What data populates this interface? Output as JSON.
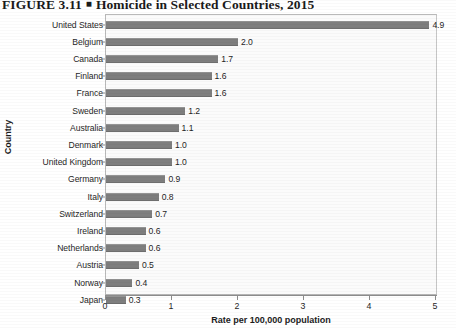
{
  "figure": {
    "number": "FIGURE 3.11",
    "separator": "■",
    "title": "Homicide in Selected Countries, 2015"
  },
  "chart_data": {
    "type": "bar",
    "orientation": "horizontal",
    "title": "Homicide in Selected Countries, 2015",
    "xlabel": "Rate per 100,000 population",
    "ylabel": "Country",
    "xlim": [
      0,
      5
    ],
    "xticks": [
      "0",
      "1",
      "2",
      "3",
      "4",
      "5"
    ],
    "grid": false,
    "legend": null,
    "categories": [
      "United States",
      "Belgium",
      "Canada",
      "Finland",
      "France",
      "Sweden",
      "Australia",
      "Denmark",
      "United Kingdom",
      "Germany",
      "Italy",
      "Switzerland",
      "Ireland",
      "Netherlands",
      "Austria",
      "Norway",
      "Japan"
    ],
    "values": [
      4.9,
      2.0,
      1.7,
      1.6,
      1.6,
      1.2,
      1.1,
      1.0,
      1.0,
      0.9,
      0.8,
      0.7,
      0.6,
      0.6,
      0.5,
      0.4,
      0.3
    ],
    "value_labels": [
      "4.9",
      "2.0",
      "1.7",
      "1.6",
      "1.6",
      "1.2",
      "1.1",
      "1.0",
      "1.0",
      "0.9",
      "0.8",
      "0.7",
      "0.6",
      "0.6",
      "0.5",
      "0.4",
      "0.3"
    ],
    "bar_color": "#7e7e7e",
    "plot_background": "#fbfbfb"
  }
}
